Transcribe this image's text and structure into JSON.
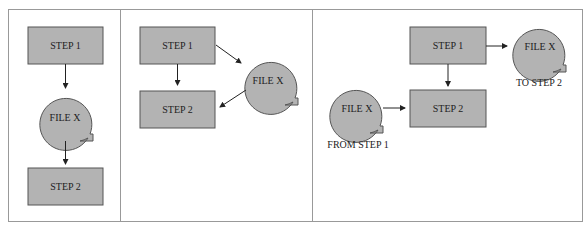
{
  "panels": [
    {
      "id": "panel-1",
      "step1": "STEP 1",
      "file": "FILE X",
      "step2": "STEP 2"
    },
    {
      "id": "panel-2",
      "step1": "STEP 1",
      "file": "FILE X",
      "step2": "STEP 2"
    },
    {
      "id": "panel-3",
      "step1": "STEP 1",
      "file_out": "FILE X",
      "file_out_caption": "TO STEP 2",
      "file_in": "FILE X",
      "file_in_caption": "FROM STEP 1",
      "step2": "STEP 2"
    }
  ],
  "colors": {
    "box_fill": "#b3b3b3",
    "border": "#555555",
    "frame": "#999999"
  }
}
